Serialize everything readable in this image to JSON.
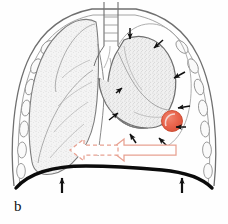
{
  "figure": {
    "panel_label": "b",
    "background_color": "#fefefe"
  },
  "colors": {
    "outline": "#4a4a4a",
    "outline_light": "#8a8a8a",
    "lung_fill": "#f2f2f2",
    "stipple": "#b9b9b9",
    "rib_outline": "#777777",
    "diaphragm": "#0b0b0b",
    "arrow_black": "#111111",
    "tumour": "#e8624a",
    "tumour_edge": "#c9492f",
    "flow_arrow": "#e8a191",
    "flow_arrow_fill": "#ffffff"
  },
  "structures": {
    "trachea": {
      "name": "trachea",
      "rings": 5
    },
    "left_lung": {
      "name": "normal-aerated-lung",
      "state": "normal"
    },
    "right_lung": {
      "name": "collapsed-lung",
      "state": "collapsed"
    },
    "tumour": {
      "name": "tumour-nodule",
      "location": "peripheral-lower-lateral"
    },
    "diaphragm": {
      "name": "diaphragm",
      "state": "elevated"
    },
    "ribs_left_count": 7,
    "ribs_right_count": 7
  },
  "annotations": {
    "collapse_arrows": {
      "label": "collapse-direction-arrows",
      "count": 8,
      "color": "#111111"
    },
    "diaphragm_arrows": {
      "label": "diaphragm-elevation-arrows",
      "count": 2,
      "color": "#111111"
    },
    "mediastinal_shift_arrows": {
      "label": "mediastinal-shift-arrows",
      "count": 2,
      "solid_label": "solid-shift-arrow",
      "dashed_label": "dashed-shift-arrow",
      "direction": "left",
      "color": "#e8a191"
    }
  }
}
